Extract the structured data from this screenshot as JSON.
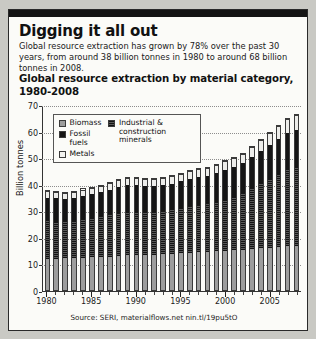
{
  "card": {
    "headline": "Digging it all out",
    "standfirst": "Global resource extraction has grown by 78% over the past 30 years, from around 38 billion tonnes in 1980 to around 68 billion tonnes in 2008.",
    "chart_title": "Global resource extraction by material category, 1980-2008",
    "source": "Source: SERI, materialflows.net nin.tl/19pu5tO"
  },
  "legend": {
    "items": [
      {
        "label": "Biomass",
        "swatch": "biomass",
        "color": "#9d9d9d"
      },
      {
        "label": "Fossil fuels",
        "swatch": "fossil",
        "color": "#151515"
      },
      {
        "label": "Metals",
        "swatch": "metals",
        "color": "#f2f2ef"
      },
      {
        "label": "Industrial & construction minerals",
        "swatch": "icm",
        "color": "#6a6a6a"
      }
    ]
  },
  "chart_data": {
    "type": "bar",
    "subtype": "stacked",
    "title": "Global resource extraction by material category, 1980-2008",
    "xlabel": "",
    "ylabel": "Billion tonnes",
    "ylim": [
      0,
      70
    ],
    "yticks": [
      0,
      10,
      20,
      30,
      40,
      50,
      60,
      70
    ],
    "grid": "horizontal-dotted",
    "legend_position": "inside-top-left",
    "categories": [
      "1980",
      "1981",
      "1982",
      "1983",
      "1984",
      "1985",
      "1986",
      "1987",
      "1988",
      "1989",
      "1990",
      "1991",
      "1992",
      "1993",
      "1994",
      "1995",
      "1996",
      "1997",
      "1998",
      "1999",
      "2000",
      "2001",
      "2002",
      "2003",
      "2004",
      "2005",
      "2006",
      "2007",
      "2008"
    ],
    "xtick_labels": [
      "1980",
      "1985",
      "1990",
      "1995",
      "2000",
      "2005"
    ],
    "series": [
      {
        "name": "Biomass",
        "color": "#9d9d9d",
        "values": [
          12.0,
          12.1,
          12.2,
          12.3,
          12.5,
          12.6,
          12.8,
          12.9,
          13.1,
          13.3,
          13.4,
          13.5,
          13.6,
          13.8,
          14.0,
          14.2,
          14.4,
          14.5,
          14.7,
          14.9,
          15.1,
          15.3,
          15.5,
          15.7,
          16.0,
          16.2,
          16.5,
          16.8,
          17.0
        ]
      },
      {
        "name": "Industrial & construction minerals",
        "color": "#6a6a6a",
        "values": [
          14.5,
          14.3,
          14.1,
          14.3,
          14.7,
          15.0,
          15.4,
          15.9,
          16.4,
          16.7,
          16.6,
          16.3,
          16.2,
          16.4,
          16.8,
          17.2,
          17.6,
          18.0,
          18.3,
          18.9,
          19.6,
          20.3,
          21.4,
          23.0,
          24.6,
          26.1,
          27.8,
          29.2,
          30.0
        ]
      },
      {
        "name": "Fossil fuels",
        "color": "#151515",
        "values": [
          9.2,
          9.0,
          8.8,
          8.8,
          9.1,
          9.3,
          9.5,
          9.8,
          10.1,
          10.3,
          10.3,
          10.2,
          10.1,
          10.1,
          10.2,
          10.4,
          10.7,
          10.9,
          10.9,
          11.0,
          11.3,
          11.5,
          11.7,
          12.2,
          12.8,
          13.2,
          13.6,
          14.0,
          14.3
        ]
      },
      {
        "name": "Metals",
        "color": "#f2f2ef",
        "values": [
          2.6,
          2.5,
          2.4,
          2.4,
          2.5,
          2.6,
          2.6,
          2.7,
          2.8,
          2.9,
          2.9,
          2.8,
          2.8,
          2.8,
          2.9,
          3.0,
          3.1,
          3.2,
          3.2,
          3.3,
          3.5,
          3.6,
          3.7,
          4.0,
          4.3,
          4.6,
          5.0,
          5.4,
          5.7
        ]
      }
    ],
    "totals": [
      38.3,
      37.9,
      37.5,
      37.8,
      38.8,
      39.5,
      40.3,
      41.3,
      42.4,
      43.2,
      43.2,
      42.8,
      42.7,
      43.1,
      43.9,
      44.8,
      45.8,
      46.6,
      47.1,
      48.1,
      49.5,
      50.7,
      52.3,
      54.9,
      57.7,
      60.1,
      62.9,
      65.4,
      67.0
    ]
  }
}
